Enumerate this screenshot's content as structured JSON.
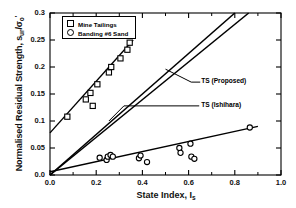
{
  "chart_data": {
    "type": "scatter",
    "title": "",
    "xlabel": "State Index, Iₛ",
    "ylabel": "Normalised Residual Strength, sᵤᵣ/σₒ'",
    "xlim": [
      0.0,
      1.0
    ],
    "ylim": [
      0.0,
      0.3
    ],
    "xticks": [
      "0.0",
      "0.2",
      "0.4",
      "0.6",
      "0.8",
      "1.0"
    ],
    "xtick_values": [
      0.0,
      0.2,
      0.4,
      0.6,
      0.8,
      1.0
    ],
    "yticks": [
      "0.0",
      "0.05",
      "0.1",
      "0.15",
      "0.2",
      "0.25",
      "0.3"
    ],
    "ytick_values": [
      0.0,
      0.05,
      0.1,
      0.15,
      0.2,
      0.25,
      0.3
    ],
    "grid": false,
    "legend_position": "top-left",
    "series": [
      {
        "name": "Mine Tailings",
        "marker": "square",
        "points": [
          {
            "x": 0.075,
            "y": 0.108
          },
          {
            "x": 0.155,
            "y": 0.14
          },
          {
            "x": 0.175,
            "y": 0.152
          },
          {
            "x": 0.185,
            "y": 0.128
          },
          {
            "x": 0.205,
            "y": 0.168
          },
          {
            "x": 0.255,
            "y": 0.19
          },
          {
            "x": 0.265,
            "y": 0.2
          },
          {
            "x": 0.305,
            "y": 0.216
          },
          {
            "x": 0.335,
            "y": 0.232
          },
          {
            "x": 0.345,
            "y": 0.245
          }
        ],
        "fit_line": {
          "x0": 0.0,
          "y0": 0.078,
          "x1": 0.36,
          "y1": 0.25
        }
      },
      {
        "name": "Banding #6 Sand",
        "marker": "circle",
        "points": [
          {
            "x": 0.215,
            "y": 0.032
          },
          {
            "x": 0.245,
            "y": 0.028
          },
          {
            "x": 0.25,
            "y": 0.034
          },
          {
            "x": 0.262,
            "y": 0.037
          },
          {
            "x": 0.272,
            "y": 0.034
          },
          {
            "x": 0.385,
            "y": 0.031
          },
          {
            "x": 0.392,
            "y": 0.036
          },
          {
            "x": 0.42,
            "y": 0.024
          },
          {
            "x": 0.56,
            "y": 0.05
          },
          {
            "x": 0.565,
            "y": 0.041
          },
          {
            "x": 0.608,
            "y": 0.058
          },
          {
            "x": 0.612,
            "y": 0.034
          },
          {
            "x": 0.625,
            "y": 0.03
          },
          {
            "x": 0.865,
            "y": 0.088
          }
        ],
        "fit_line": {
          "x0": 0.0,
          "y0": 0.006,
          "x1": 0.9,
          "y1": 0.09
        }
      }
    ],
    "reference_lines": [
      {
        "name": "TS (Proposed)",
        "x0": 0.0,
        "y0": 0.0,
        "x1": 0.8,
        "y1": 0.3
      },
      {
        "name": "TS (Ishihara)",
        "x0": 0.0,
        "y0": 0.0,
        "x1": 0.86,
        "y1": 0.3
      }
    ],
    "annotations": [
      {
        "text": "TS (Proposed)",
        "x": 0.62,
        "y": 0.172
      },
      {
        "text": "TS (Ishihara)",
        "x": 0.62,
        "y": 0.128
      }
    ]
  }
}
